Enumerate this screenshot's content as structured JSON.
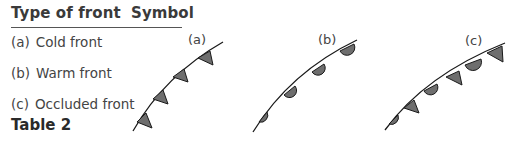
{
  "table": {
    "headers": {
      "type": "Type of front",
      "symbol": "Symbol"
    },
    "rows": [
      {
        "label": "(a)",
        "name": "Cold front"
      },
      {
        "label": "(b)",
        "name": "Warm front"
      },
      {
        "label": "(c)",
        "name": "Occluded front"
      }
    ],
    "caption": "Table 2"
  },
  "symbols": [
    {
      "label": "(a)",
      "type": "cold-front",
      "marker": "triangles",
      "count": 4
    },
    {
      "label": "(b)",
      "type": "warm-front",
      "marker": "semicircles",
      "count": 4
    },
    {
      "label": "(c)",
      "type": "occluded-front",
      "marker": "alternating triangles and semicircles",
      "count": 6
    }
  ],
  "colors": {
    "line": "#1a1a1a",
    "fill": "#6e6e6e",
    "text": "#3a3a3a"
  }
}
